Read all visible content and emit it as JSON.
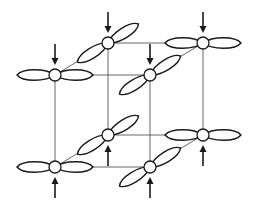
{
  "diagram": {
    "type": "cubic-lattice-orbital-ordering",
    "colors": {
      "line": "#1a1a1a",
      "edge": "#555555",
      "background": "#ffffff"
    },
    "nodes": [
      {
        "id": "top-front-left",
        "x": 55,
        "y": 75,
        "orbital": "horizontal",
        "spin": "down"
      },
      {
        "id": "top-front-right",
        "x": 150,
        "y": 75,
        "orbital": "diagonal",
        "spin": "down"
      },
      {
        "id": "top-back-left",
        "x": 108,
        "y": 43,
        "orbital": "diagonal",
        "spin": "down"
      },
      {
        "id": "top-back-right",
        "x": 203,
        "y": 43,
        "orbital": "horizontal",
        "spin": "down"
      },
      {
        "id": "bottom-front-left",
        "x": 55,
        "y": 167,
        "orbital": "horizontal",
        "spin": "up"
      },
      {
        "id": "bottom-front-right",
        "x": 150,
        "y": 167,
        "orbital": "diagonal",
        "spin": "up"
      },
      {
        "id": "bottom-back-left",
        "x": 108,
        "y": 135,
        "orbital": "diagonal",
        "spin": "up"
      },
      {
        "id": "bottom-back-right",
        "x": 203,
        "y": 135,
        "orbital": "horizontal",
        "spin": "up"
      }
    ],
    "edges": [
      [
        "top-front-left",
        "top-front-right"
      ],
      [
        "top-front-left",
        "top-back-left"
      ],
      [
        "top-back-left",
        "top-back-right"
      ],
      [
        "top-front-right",
        "top-back-right"
      ],
      [
        "bottom-front-left",
        "bottom-front-right"
      ],
      [
        "bottom-front-left",
        "bottom-back-left"
      ],
      [
        "bottom-back-left",
        "bottom-back-right"
      ],
      [
        "bottom-front-right",
        "bottom-back-right"
      ],
      [
        "top-front-left",
        "bottom-front-left"
      ],
      [
        "top-front-right",
        "bottom-front-right"
      ],
      [
        "top-back-left",
        "bottom-back-left"
      ],
      [
        "top-back-right",
        "bottom-back-right"
      ]
    ]
  }
}
